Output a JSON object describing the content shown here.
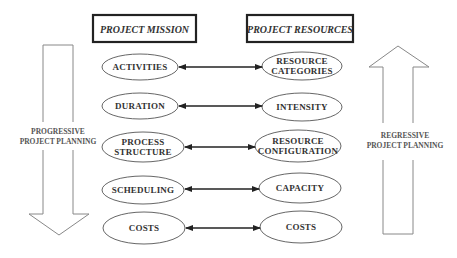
{
  "diagram": {
    "headers": {
      "left": {
        "label": "PROJECT MISSION",
        "x": 93,
        "y": 15,
        "w": 103,
        "h": 27
      },
      "right": {
        "label": "PROJECT RESOURCES",
        "x": 247,
        "y": 15,
        "w": 106,
        "h": 27
      }
    },
    "rows": [
      {
        "left": {
          "lines": [
            "ACTIVITIES"
          ],
          "cx": 140,
          "cy": 67,
          "rx": 38,
          "ry": 13
        },
        "right": {
          "lines": [
            "RESOURCE",
            "CATEGORIES"
          ],
          "cx": 302,
          "cy": 66,
          "rx": 40,
          "ry": 14
        },
        "arrow": {
          "x1": 179,
          "x2": 262,
          "y": 67
        }
      },
      {
        "left": {
          "lines": [
            "DURATION"
          ],
          "cx": 140,
          "cy": 106,
          "rx": 38,
          "ry": 13
        },
        "right": {
          "lines": [
            "INTENSITY"
          ],
          "cx": 302,
          "cy": 107,
          "rx": 40,
          "ry": 14
        },
        "arrow": {
          "x1": 179,
          "x2": 262,
          "y": 106
        }
      },
      {
        "left": {
          "lines": [
            "PROCESS",
            "STRUCTURE"
          ],
          "cx": 143,
          "cy": 147,
          "rx": 41,
          "ry": 15
        },
        "right": {
          "lines": [
            "RESOURCE",
            "CONFIGURATION"
          ],
          "cx": 298,
          "cy": 146,
          "rx": 43,
          "ry": 16
        },
        "arrow": {
          "x1": 185,
          "x2": 255,
          "y": 147
        }
      },
      {
        "left": {
          "lines": [
            "SCHEDULING"
          ],
          "cx": 143,
          "cy": 190,
          "rx": 41,
          "ry": 14
        },
        "right": {
          "lines": [
            "CAPACITY"
          ],
          "cx": 300,
          "cy": 188,
          "rx": 41,
          "ry": 15
        },
        "arrow": {
          "x1": 185,
          "x2": 259,
          "y": 189
        }
      },
      {
        "left": {
          "lines": [
            "COSTS"
          ],
          "cx": 144,
          "cy": 228,
          "rx": 41,
          "ry": 16
        },
        "right": {
          "lines": [
            "COSTS"
          ],
          "cx": 301,
          "cy": 227,
          "rx": 41,
          "ry": 16
        },
        "arrow": {
          "x1": 186,
          "x2": 260,
          "y": 228
        }
      }
    ],
    "left_arrow": {
      "direction": "down",
      "label_lines": [
        "PROGRESSIVE",
        "PROJECT PLANNING"
      ],
      "shaft_left": 43,
      "shaft_right": 73,
      "top": 45,
      "gap_top": 122,
      "gap_bottom": 150,
      "head_y": 214,
      "head_left": 29,
      "head_right": 89,
      "tip_x": 59,
      "tip_y": 235,
      "label_x": 58,
      "label_y1": 134,
      "label_y2": 144
    },
    "right_arrow": {
      "direction": "up",
      "label_lines": [
        "REGRESSIVE",
        "PROJECT PLANNING"
      ],
      "shaft_left": 383,
      "shaft_right": 413,
      "bottom": 234,
      "gap_top": 123,
      "gap_bottom": 160,
      "head_y": 67,
      "head_left": 369,
      "head_right": 429,
      "tip_x": 398,
      "tip_y": 46,
      "label_x": 405,
      "label_y1": 138,
      "label_y2": 148
    },
    "colors": {
      "box_stroke": "#222222",
      "ellipse_stroke": "#555555",
      "text": "#333333",
      "connector": "#222222",
      "big_arrow_stroke": "#888888"
    }
  }
}
